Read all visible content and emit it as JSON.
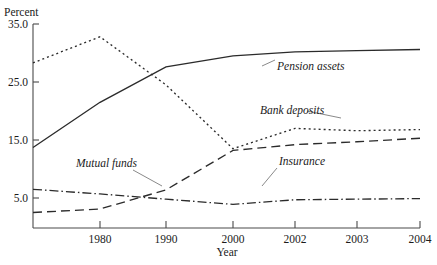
{
  "chart_data": {
    "type": "line",
    "title": "",
    "xlabel": "Year",
    "ylabel": "Percent",
    "ylim": [
      0,
      35
    ],
    "yticks": [
      5.0,
      15.0,
      25.0,
      35.0
    ],
    "ytick_labels": [
      "5.0",
      "15.0",
      "25.0",
      "35.0"
    ],
    "x": [
      1970,
      1980,
      1990,
      2000,
      2002,
      2003,
      2004
    ],
    "categories": [
      "",
      "1980",
      "1990",
      "2000",
      "2002",
      "2003",
      "2004"
    ],
    "xtick_labels": [
      "1980",
      "1990",
      "2000",
      "2002",
      "2003",
      "2004"
    ],
    "grid": false,
    "legend": "inline-annotations",
    "series": [
      {
        "name": "Pension assets",
        "style": "solid",
        "values": [
          13.7,
          21.5,
          27.6,
          29.5,
          30.2,
          30.4,
          30.6
        ]
      },
      {
        "name": "Bank deposits",
        "style": "short-dash",
        "values": [
          28.3,
          32.8,
          24.5,
          13.5,
          17.0,
          16.6,
          16.8
        ]
      },
      {
        "name": "Mutual funds",
        "style": "long-dash",
        "values": [
          2.5,
          3.1,
          6.4,
          13.2,
          14.2,
          14.7,
          15.3
        ]
      },
      {
        "name": "Insurance",
        "style": "dash-dot",
        "values": [
          6.5,
          5.7,
          4.8,
          3.9,
          4.7,
          4.8,
          4.9
        ]
      }
    ],
    "annotations": [
      {
        "text": "Pension assets",
        "series": "Pension assets"
      },
      {
        "text": "Bank deposits",
        "series": "Bank deposits"
      },
      {
        "text": "Mutual funds",
        "series": "Mutual funds"
      },
      {
        "text": "Insurance",
        "series": "Insurance"
      }
    ]
  }
}
